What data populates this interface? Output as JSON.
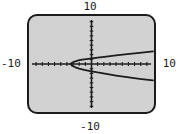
{
  "figure": {
    "kind": "graphing-calculator-screen",
    "labels": {
      "top": "10",
      "bottom": "-10",
      "left": "-10",
      "right": "10"
    },
    "colors": {
      "screen_background": "#d2d2d2",
      "screen_border": "#1c1c1c",
      "axis": "#1c1c1c",
      "curve": "#1c1c1c",
      "page_background": "#ffffff",
      "label_text": "#1a1a1a"
    }
  },
  "chart_data": {
    "type": "line",
    "title": "",
    "subtitle": "",
    "xlabel": "",
    "ylabel": "",
    "xlim": [
      -10,
      10
    ],
    "ylim": [
      -10,
      10
    ],
    "xticks": [
      -9,
      -8,
      -7,
      -6,
      -5,
      -4,
      -3,
      -2,
      -1,
      0,
      1,
      2,
      3,
      4,
      5,
      6,
      7,
      8,
      9
    ],
    "yticks": [
      -9,
      -8,
      -7,
      -6,
      -5,
      -4,
      -3,
      -2,
      -1,
      0,
      1,
      2,
      3,
      4,
      5,
      6,
      7,
      8,
      9
    ],
    "tick_labels_shown": false,
    "grid": false,
    "legend": "none",
    "axes_drawn": [
      "x-axis at y=0",
      "y-axis at x=0"
    ],
    "tick_spacing": 1,
    "annotations": [
      "window range -10 to 10 on both axes",
      "sideways parabola opening to the right",
      "vertex at approximately x = -3.4, y = 0"
    ],
    "series": [
      {
        "name": "upper branch",
        "style": "solid",
        "x": [
          -3.4,
          -3.2,
          -3.0,
          -2.6,
          -2.0,
          -1.2,
          -0.2,
          1.0,
          2.4,
          4.0,
          5.8,
          7.8,
          10.0
        ],
        "y": [
          0.0,
          0.26,
          0.38,
          0.58,
          0.8,
          1.0,
          1.16,
          1.36,
          1.58,
          1.83,
          2.1,
          2.39,
          2.68
        ]
      },
      {
        "name": "lower branch",
        "style": "solid",
        "x": [
          -3.4,
          -3.2,
          -3.0,
          -2.6,
          -2.0,
          -1.2,
          -0.2,
          1.0,
          2.4,
          4.0,
          5.8,
          7.8,
          10.0
        ],
        "y": [
          0.0,
          -0.3,
          -0.45,
          -0.7,
          -0.98,
          -1.25,
          -1.5,
          -1.8,
          -2.1,
          -2.45,
          -2.8,
          -3.15,
          -3.5
        ]
      }
    ],
    "equation_form": "x = a*y^2 + c (sideways parabola)"
  }
}
